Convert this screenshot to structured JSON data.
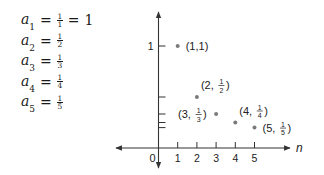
{
  "equations": [
    {
      "var": "a",
      "sub": "1",
      "num": "1",
      "den": "1",
      "result": "1"
    },
    {
      "var": "a",
      "sub": "2",
      "num": "1",
      "den": "2",
      "result": ""
    },
    {
      "var": "a",
      "sub": "3",
      "num": "1",
      "den": "3",
      "result": ""
    },
    {
      "var": "a",
      "sub": "4",
      "num": "1",
      "den": "4",
      "result": ""
    },
    {
      "var": "a",
      "sub": "5",
      "num": "1",
      "den": "5",
      "result": ""
    }
  ],
  "chart_data": {
    "type": "scatter",
    "title": "",
    "xlabel": "n",
    "ylabel": "",
    "xlim": [
      -2.2,
      6.5
    ],
    "ylim": [
      -0.2,
      1.3
    ],
    "x_ticks": [
      1,
      2,
      3,
      4,
      5
    ],
    "x_tick_labels": [
      "1",
      "2",
      "3",
      "4",
      "5"
    ],
    "y_ticks": [
      1,
      0.5,
      0.3333,
      0.25,
      0.2
    ],
    "y_tick_labels": [
      "1",
      "",
      "",
      "",
      ""
    ],
    "origin_label": "0",
    "grid": false,
    "color": "#7a7a7a",
    "points": [
      {
        "x": 1,
        "y": 1,
        "label_main": "(1,1)",
        "label_num": "",
        "label_den": "",
        "label_side": "right"
      },
      {
        "x": 2,
        "y": 0.5,
        "label_main": "(2,",
        "label_num": "1",
        "label_den": "2",
        "label_side": "upper-right"
      },
      {
        "x": 3,
        "y": 0.3333,
        "label_main": "(3,",
        "label_num": "1",
        "label_den": "3",
        "label_side": "left"
      },
      {
        "x": 4,
        "y": 0.25,
        "label_main": "(4,",
        "label_num": "1",
        "label_den": "4",
        "label_side": "upper-right"
      },
      {
        "x": 5,
        "y": 0.2,
        "label_main": "(5,",
        "label_num": "1",
        "label_den": "5",
        "label_side": "right"
      }
    ]
  }
}
